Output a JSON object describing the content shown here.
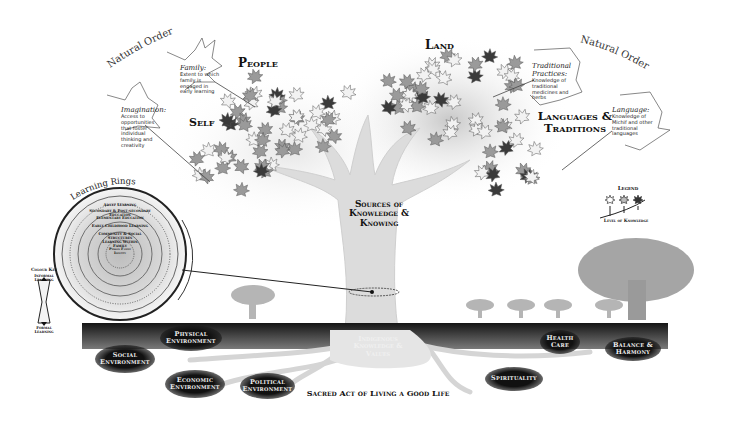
{
  "headings": {
    "natural_order_left": "Natural Order",
    "natural_order_right": "Natural Order",
    "people": "People",
    "land": "Land",
    "self": "Self",
    "languages_traditions": "Languages & Traditions",
    "sources": "Sources of Knowledge & Knowing",
    "learning_rings": "Learning Rings",
    "indigenous": "Indigenous Knowledge & Values",
    "sacred": "Sacred Act of Living a Good Life"
  },
  "callouts": {
    "family": {
      "title": "Family:",
      "text": "Extent to which family is engaged in early learning"
    },
    "imagination": {
      "title": "Imagination:",
      "text": "Access to opportunities that foster individual thinking and creativity"
    },
    "traditional_practices": {
      "title": "Traditional Practices:",
      "text": "Knowledge of traditional medicines and herbs"
    },
    "language": {
      "title": "Language:",
      "text": "Knowledge of Michif and other traditional languages"
    }
  },
  "legend": {
    "title": "Legend",
    "caption": "Level of Knowledge",
    "levels": [
      "low",
      "medium",
      "high"
    ]
  },
  "colour_key": {
    "title": "Colour Key",
    "top": "Informal Learning",
    "bottom": "Formal Learning"
  },
  "rings": {
    "labels": [
      "Adult Learning",
      "Secondary & Post-secondary Education",
      "Elementary Education",
      "Early Childhood Learning",
      "Community & Social Structures",
      "Learning Within Family",
      "Person Family Identity"
    ]
  },
  "roots": [
    {
      "label": "Social Environment"
    },
    {
      "label": "Physical Environment"
    },
    {
      "label": "Economic Environment"
    },
    {
      "label": "Political Environment"
    },
    {
      "label": "Health Care"
    },
    {
      "label": "Balance & Harmony"
    },
    {
      "label": "Spirituality"
    }
  ],
  "colors": {
    "ground": "#2a2a2a",
    "leaf_dark": "#3a3a3a",
    "leaf_mid": "#9a9a9a",
    "leaf_light": "#f2f2f2",
    "trunk": "#d9d9d9",
    "bg_tree": "#a8a8a8"
  }
}
